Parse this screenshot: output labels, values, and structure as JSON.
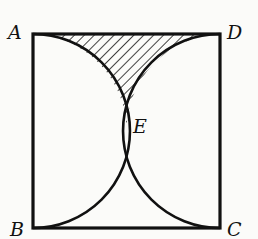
{
  "figure": {
    "type": "geometry",
    "labels": {
      "A": "A",
      "B": "B",
      "C": "C",
      "D": "D",
      "E": "E"
    },
    "colors": {
      "stroke": "#111111",
      "background": "#fbfbf9"
    }
  }
}
